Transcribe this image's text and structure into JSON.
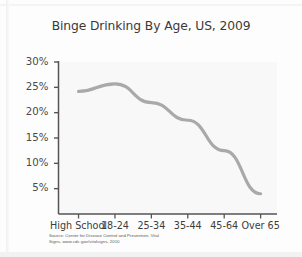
{
  "chart_data": {
    "type": "line",
    "title": "Binge Drinking By Age, US, 2009",
    "xlabel": "",
    "ylabel": "",
    "categories": [
      "High School",
      "18-24",
      "25-34",
      "35-44",
      "45-64",
      "Over 65"
    ],
    "values": [
      24.2,
      25.7,
      22.0,
      18.5,
      12.5,
      4.0
    ],
    "series": [
      {
        "name": "Binge drinking prevalence",
        "values": [
          24.2,
          25.7,
          22.0,
          18.5,
          12.5,
          4.0
        ]
      }
    ],
    "ytick_labels": [
      "30%",
      "25%",
      "20%",
      "15%",
      "10%",
      "5%"
    ],
    "ytick_values": [
      30,
      25,
      20,
      15,
      10,
      5
    ],
    "ylim": [
      0,
      30
    ],
    "grid": false,
    "legend": "none",
    "line_color": "#a9a9a9",
    "plot_background": "#f4f4f4",
    "axis_color": "#555555"
  },
  "source": {
    "line1": "Source: Center for Disease Control and Prevention, Vital",
    "line2": "Signs, www.cdc.gov/vitalsigns, 2010"
  }
}
